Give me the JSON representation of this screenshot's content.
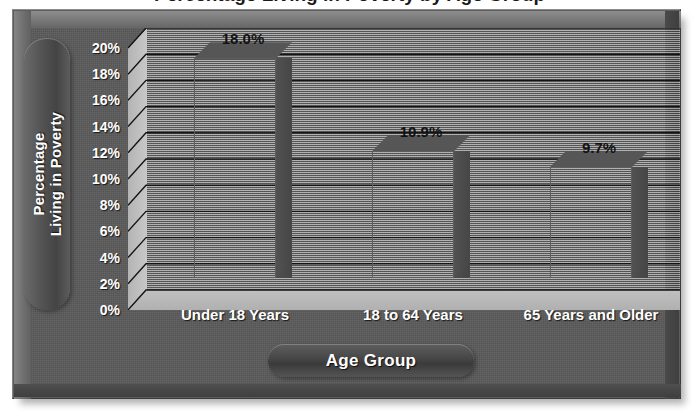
{
  "chart_data": {
    "type": "bar",
    "title": "Percentage Living in Poverty by Age Group",
    "title_visible_fragment": "(title cropped at top edge of image)",
    "categories": [
      "Under 18 Years",
      "18 to 64 Years",
      "65 Years and Older"
    ],
    "values": [
      18.0,
      10.9,
      9.7
    ],
    "value_labels": [
      "18.0%",
      "10.9%",
      "9.7%"
    ],
    "xlabel": "Age Group",
    "ylabel": "Percentage Living in Poverty",
    "ylabel_line1": "Percentage",
    "ylabel_line2": "Living in Poverty",
    "ylim": [
      0,
      20
    ],
    "ytick_step": 2,
    "ytick_labels": [
      "20%",
      "18%",
      "16%",
      "14%",
      "12%",
      "10%",
      "8%",
      "6%",
      "4%",
      "2%",
      "0%"
    ],
    "ytick_values": [
      20,
      18,
      16,
      14,
      12,
      10,
      8,
      6,
      4,
      2,
      0
    ],
    "grid": true,
    "grid_axis": "y",
    "legend": false,
    "style": "3d-bar",
    "colors": {
      "bar_front": "#7e7e7e",
      "bar_top": "#565656",
      "bar_side": "#4a4a4a",
      "plot_background": "#d8d8d8",
      "floor": "#b8b8b8",
      "frame": "#5a5a5a",
      "gridline": "#1a1a1a",
      "tick_text": "#ffffff",
      "value_text": "#121212"
    }
  }
}
